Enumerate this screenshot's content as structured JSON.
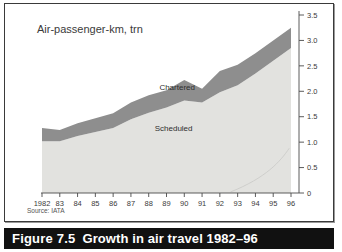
{
  "figure": {
    "caption_number": "Figure 7.5",
    "caption_text": "Growth in air travel 1982–96",
    "source": "Source: IATA",
    "background": "#ffffff",
    "caption_background": "#111111",
    "caption_color": "#ffffff"
  },
  "chart_data": {
    "type": "area",
    "title": "Air-passenger-km, trn",
    "xlabel": "",
    "ylabel": "",
    "stacked": true,
    "grid": false,
    "legend_position": "inline-labels",
    "axis_side": "right",
    "ylim": [
      0,
      3.5
    ],
    "yticks": [
      0,
      0.5,
      1.0,
      1.5,
      2.0,
      2.5,
      3.0,
      3.5
    ],
    "ytick_labels": [
      "0",
      "0.5",
      "1.0",
      "1.5",
      "2.0",
      "2.5",
      "3.0",
      "3.5"
    ],
    "categories": [
      1982,
      1983,
      1984,
      1985,
      1986,
      1987,
      1988,
      1989,
      1990,
      1991,
      1992,
      1993,
      1994,
      1995,
      1996
    ],
    "xtick_labels": [
      "1982",
      "83",
      "84",
      "85",
      "86",
      "87",
      "88",
      "89",
      "90",
      "91",
      "92",
      "93",
      "94",
      "95",
      "96"
    ],
    "series": [
      {
        "name": "Scheduled",
        "color": "#e2e2df",
        "values": [
          1.02,
          1.02,
          1.12,
          1.2,
          1.28,
          1.45,
          1.58,
          1.68,
          1.82,
          1.78,
          1.98,
          2.12,
          2.35,
          2.6,
          2.85
        ]
      },
      {
        "name": "Chartered",
        "color": "#8e8e8e",
        "values": [
          0.26,
          0.22,
          0.25,
          0.27,
          0.29,
          0.33,
          0.34,
          0.34,
          0.4,
          0.27,
          0.42,
          0.4,
          0.4,
          0.4,
          0.4
        ]
      }
    ],
    "totals": [
      1.28,
      1.24,
      1.37,
      1.47,
      1.57,
      1.78,
      1.92,
      2.02,
      2.22,
      2.05,
      2.4,
      2.52,
      2.75,
      3.0,
      3.25
    ],
    "annotations": [
      {
        "text": "Chartered",
        "x": 1989.6,
        "y": 2.02
      },
      {
        "text": "Scheduled",
        "x": 1989.4,
        "y": 1.22
      }
    ]
  }
}
